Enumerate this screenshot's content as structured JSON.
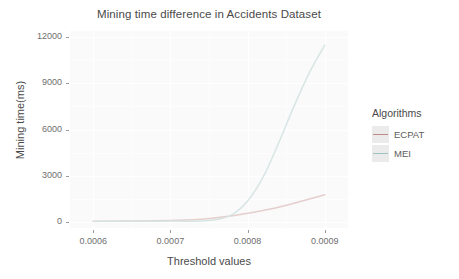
{
  "chart_data": {
    "type": "line",
    "title": "Mining time difference in Accidents Dataset",
    "xlabel": "Threshold values",
    "ylabel": "Mining time(ms)",
    "xlim": [
      0.00057,
      0.00093
    ],
    "ylim": [
      -400,
      12400
    ],
    "xticks": [
      "0.0006",
      "0.0007",
      "0.0008",
      "0.0009"
    ],
    "xtick_values": [
      0.0006,
      0.0007,
      0.0008,
      0.0009
    ],
    "yticks": [
      "0",
      "3000",
      "6000",
      "9000",
      "12000"
    ],
    "ytick_values": [
      0,
      3000,
      6000,
      9000,
      12000
    ],
    "grid": true,
    "legend_position": "right",
    "legend_title": "Algorithms",
    "x": [
      0.0006,
      0.00062,
      0.00064,
      0.00066,
      0.00068,
      0.0007,
      0.00072,
      0.00074,
      0.00076,
      0.00078,
      0.0008,
      0.00082,
      0.00084,
      0.00086,
      0.00088,
      0.0009
    ],
    "series": [
      {
        "name": "ECPAT",
        "color": "#c08b86",
        "values": [
          40,
          45,
          50,
          58,
          68,
          85,
          120,
          175,
          260,
          390,
          560,
          740,
          950,
          1210,
          1480,
          1760
        ]
      },
      {
        "name": "MEI",
        "color": "#9fc3c0",
        "values": [
          30,
          32,
          34,
          36,
          40,
          48,
          45,
          60,
          150,
          470,
          1350,
          2900,
          5100,
          7500,
          9700,
          11480
        ]
      }
    ]
  },
  "chart": {
    "title": "Mining time difference in Accidents Dataset",
    "xlabel": "Threshold values",
    "ylabel": "Mining time(ms)"
  },
  "legend": {
    "title": "Algorithms",
    "items": [
      {
        "label": "ECPAT",
        "color": "#c08b86"
      },
      {
        "label": "MEI",
        "color": "#9fc3c0"
      }
    ]
  },
  "axes": {
    "y": {
      "ticks": [
        "0",
        "3000",
        "6000",
        "9000",
        "12000"
      ]
    },
    "x": {
      "ticks": [
        "0.0006",
        "0.0007",
        "0.0008",
        "0.0009"
      ]
    }
  }
}
